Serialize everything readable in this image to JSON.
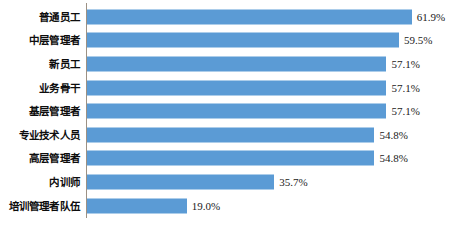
{
  "chart_data": {
    "type": "bar",
    "orientation": "horizontal",
    "title": "",
    "subtitle": "",
    "xlabel": "",
    "ylabel": "",
    "xlim": [
      0,
      70
    ],
    "grid": false,
    "legend": false,
    "legend_position": "none",
    "value_suffix": "%",
    "series": [
      {
        "name": "",
        "color": "#5b9bd5",
        "values": [
          61.9,
          59.5,
          57.1,
          57.1,
          57.1,
          54.8,
          54.8,
          35.7,
          19.0
        ]
      }
    ],
    "categories": [
      "普通员工",
      "中层管理者",
      "新员工",
      "业务骨干",
      "基层管理者",
      "专业技术人员",
      "高层管理者",
      "内训师",
      "培训管理者队伍"
    ],
    "data_labels": [
      "61.9%",
      "59.5%",
      "57.1%",
      "57.1%",
      "57.1%",
      "54.8%",
      "54.8%",
      "35.7%",
      "19.0%"
    ],
    "points": [
      {
        "category": "普通员工",
        "value": 61.9,
        "label": "61.9%"
      },
      {
        "category": "中层管理者",
        "value": 59.5,
        "label": "59.5%"
      },
      {
        "category": "新员工",
        "value": 57.1,
        "label": "57.1%"
      },
      {
        "category": "业务骨干",
        "value": 57.1,
        "label": "57.1%"
      },
      {
        "category": "基层管理者",
        "value": 57.1,
        "label": "57.1%"
      },
      {
        "category": "专业技术人员",
        "value": 54.8,
        "label": "54.8%"
      },
      {
        "category": "高层管理者",
        "value": 54.8,
        "label": "54.8%"
      },
      {
        "category": "内训师",
        "value": 35.7,
        "label": "35.7%"
      },
      {
        "category": "培训管理者队伍",
        "value": 19.0,
        "label": "19.0%"
      }
    ]
  },
  "colors": {
    "bar": "#5b9bd5",
    "axis_line": "#9c9184",
    "category_text": "#0d0d0d",
    "value_text": "#1a1a1a",
    "background": "#ffffff"
  }
}
